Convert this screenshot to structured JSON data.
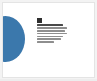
{
  "viewer": {
    "name": "document-thumbnail",
    "background_color": "#f3f3f3"
  },
  "page": {
    "background_color": "#ffffff",
    "border_color": "#e4e4e4"
  },
  "graphic": {
    "shape": "circle",
    "color": "#3b78ac",
    "position": "left-edge-bleed"
  },
  "content": {
    "logo": {
      "name": "brand-mark-icon",
      "color": "#2f2f2f"
    },
    "lines": [
      {
        "label": "",
        "width_class": "w88",
        "kind": "heading"
      },
      {
        "label": "",
        "width_class": "w100",
        "kind": "body"
      },
      {
        "label": "",
        "width_class": "w94",
        "kind": "body"
      },
      {
        "label": "",
        "width_class": "w100",
        "kind": "body"
      },
      {
        "label": "",
        "width_class": "w88",
        "kind": "body"
      },
      {
        "label": "",
        "width_class": "w80",
        "kind": "body"
      },
      {
        "label": "",
        "width_class": "w58",
        "kind": "body"
      }
    ],
    "text_color": "#8e8e8e"
  }
}
